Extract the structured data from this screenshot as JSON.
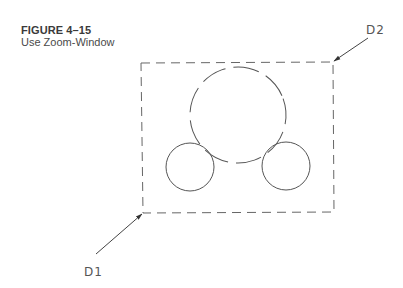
{
  "figure": {
    "number": "FIGURE 4–15",
    "title": "Use Zoom-Window"
  },
  "drawing": {
    "window_rectangle": {
      "corners": {
        "top_left": [
          141,
          63
        ],
        "top_right": [
          333,
          62
        ],
        "bottom_right": [
          334,
          212
        ],
        "bottom_left": [
          143,
          213
        ]
      },
      "style": "dashed"
    },
    "circles": [
      {
        "name": "large-circle",
        "cx": 238,
        "cy": 115,
        "r": 48,
        "style": "dashed"
      },
      {
        "name": "left-small-circle",
        "cx": 190,
        "cy": 167,
        "r": 24,
        "style": "solid"
      },
      {
        "name": "right-small-circle",
        "cx": 286,
        "cy": 166,
        "r": 24,
        "style": "solid"
      }
    ],
    "points": [
      {
        "label": "D1",
        "text_pos": [
          84,
          276
        ],
        "arrow_from": [
          96,
          254
        ],
        "arrow_to": [
          143,
          213
        ]
      },
      {
        "label": "D2",
        "text_pos": [
          366,
          34
        ],
        "arrow_from": [
          368,
          38
        ],
        "arrow_to": [
          333,
          62
        ]
      }
    ],
    "line_color": "#555555"
  }
}
